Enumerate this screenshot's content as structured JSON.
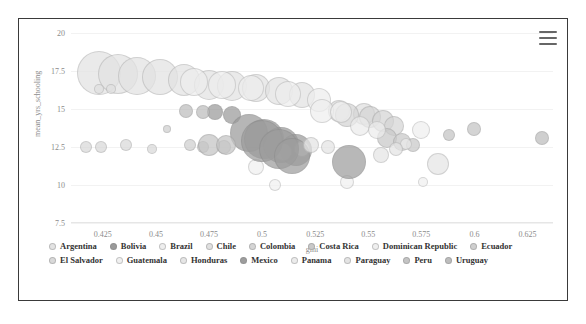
{
  "chart_data": {
    "type": "scatter",
    "title": "",
    "xlabel": "gini",
    "ylabel": "mean_yrs_schooling",
    "xlim": [
      0.41,
      0.637
    ],
    "ylim": [
      7.5,
      20
    ],
    "xticks": [
      "0.425",
      "0.45",
      "0.475",
      "0.5",
      "0.525",
      "0.55",
      "0.575",
      "0.6",
      "0.625"
    ],
    "xtick_values": [
      0.425,
      0.45,
      0.475,
      0.5,
      0.525,
      0.55,
      0.575,
      0.6,
      0.625
    ],
    "yticks": [
      "7.5",
      "10",
      "12.5",
      "15",
      "17.5",
      "20"
    ],
    "ytick_values": [
      7.5,
      10,
      12.5,
      15,
      17.5,
      20
    ],
    "grid": true,
    "legend_position": "bottom",
    "bubble_note": "bubble area encodes population; all series rendered in desaturated grayscale",
    "series": [
      {
        "name": "Argentina",
        "color": "#e3e3e3",
        "points": [
          {
            "x": 0.423,
            "y": 17.4,
            "r": 22
          },
          {
            "x": 0.432,
            "y": 17.3,
            "r": 20
          },
          {
            "x": 0.441,
            "y": 17.2,
            "r": 19
          },
          {
            "x": 0.452,
            "y": 17.1,
            "r": 18
          },
          {
            "x": 0.463,
            "y": 16.9,
            "r": 16
          },
          {
            "x": 0.475,
            "y": 16.6,
            "r": 15
          },
          {
            "x": 0.486,
            "y": 16.5,
            "r": 15
          },
          {
            "x": 0.497,
            "y": 16.4,
            "r": 14
          },
          {
            "x": 0.508,
            "y": 16.2,
            "r": 14
          },
          {
            "x": 0.519,
            "y": 15.9,
            "r": 13
          }
        ]
      },
      {
        "name": "Bolivia",
        "color": "#9a9a9a",
        "points": [
          {
            "x": 0.478,
            "y": 14.8,
            "r": 8
          },
          {
            "x": 0.486,
            "y": 14.6,
            "r": 9
          },
          {
            "x": 0.494,
            "y": 13.4,
            "r": 19
          },
          {
            "x": 0.501,
            "y": 13.0,
            "r": 20
          },
          {
            "x": 0.509,
            "y": 12.6,
            "r": 18
          },
          {
            "x": 0.516,
            "y": 12.3,
            "r": 16
          }
        ]
      },
      {
        "name": "Brazil",
        "color": "#eeeeee",
        "points": [
          {
            "x": 0.468,
            "y": 16.8,
            "r": 14
          },
          {
            "x": 0.481,
            "y": 16.6,
            "r": 14
          },
          {
            "x": 0.495,
            "y": 16.4,
            "r": 13
          },
          {
            "x": 0.512,
            "y": 16.0,
            "r": 13
          },
          {
            "x": 0.527,
            "y": 15.6,
            "r": 12
          }
        ]
      },
      {
        "name": "Chile",
        "color": "#e0e0e0",
        "points": [
          {
            "x": 0.423,
            "y": 16.3,
            "r": 5
          },
          {
            "x": 0.429,
            "y": 16.3,
            "r": 5
          },
          {
            "x": 0.536,
            "y": 14.9,
            "r": 11
          },
          {
            "x": 0.548,
            "y": 14.7,
            "r": 11
          }
        ]
      },
      {
        "name": "Colombia",
        "color": "#d5d5d5",
        "points": [
          {
            "x": 0.54,
            "y": 14.6,
            "r": 12
          },
          {
            "x": 0.551,
            "y": 14.5,
            "r": 11
          },
          {
            "x": 0.557,
            "y": 14.2,
            "r": 11
          },
          {
            "x": 0.562,
            "y": 13.9,
            "r": 10
          }
        ]
      },
      {
        "name": "Costa Rica",
        "color": "#c9c9c9",
        "points": [
          {
            "x": 0.559,
            "y": 13.1,
            "r": 10
          },
          {
            "x": 0.566,
            "y": 12.8,
            "r": 9
          },
          {
            "x": 0.571,
            "y": 12.6,
            "r": 7
          }
        ]
      },
      {
        "name": "Dominican Republic",
        "color": "#efefef",
        "points": [
          {
            "x": 0.528,
            "y": 14.9,
            "r": 12
          },
          {
            "x": 0.537,
            "y": 14.8,
            "r": 11
          },
          {
            "x": 0.575,
            "y": 13.6,
            "r": 9
          }
        ]
      },
      {
        "name": "Ecuador",
        "color": "#cfcfcf",
        "points": [
          {
            "x": 0.455,
            "y": 13.7,
            "r": 4
          },
          {
            "x": 0.466,
            "y": 12.6,
            "r": 6
          },
          {
            "x": 0.472,
            "y": 12.5,
            "r": 6
          },
          {
            "x": 0.482,
            "y": 12.5,
            "r": 7
          }
        ]
      },
      {
        "name": "El Salvador",
        "color": "#d9d9d9",
        "points": [
          {
            "x": 0.417,
            "y": 12.5,
            "r": 6
          },
          {
            "x": 0.424,
            "y": 12.5,
            "r": 6
          },
          {
            "x": 0.436,
            "y": 12.6,
            "r": 6
          },
          {
            "x": 0.448,
            "y": 12.4,
            "r": 5
          }
        ]
      },
      {
        "name": "Guatemala",
        "color": "#f0f0f0",
        "points": [
          {
            "x": 0.497,
            "y": 11.2,
            "r": 8
          },
          {
            "x": 0.506,
            "y": 10.0,
            "r": 6
          },
          {
            "x": 0.54,
            "y": 10.2,
            "r": 7
          },
          {
            "x": 0.576,
            "y": 10.2,
            "r": 5
          }
        ]
      },
      {
        "name": "Honduras",
        "color": "#e6e6e6",
        "points": [
          {
            "x": 0.51,
            "y": 12.2,
            "r": 9
          },
          {
            "x": 0.519,
            "y": 12.4,
            "r": 8
          },
          {
            "x": 0.556,
            "y": 12.0,
            "r": 8
          },
          {
            "x": 0.583,
            "y": 11.4,
            "r": 11
          }
        ]
      },
      {
        "name": "Mexico",
        "color": "#9d9d9d",
        "points": [
          {
            "x": 0.5,
            "y": 12.9,
            "r": 21
          },
          {
            "x": 0.508,
            "y": 12.4,
            "r": 20
          },
          {
            "x": 0.514,
            "y": 11.9,
            "r": 18
          },
          {
            "x": 0.541,
            "y": 11.5,
            "r": 17
          }
        ]
      },
      {
        "name": "Panama",
        "color": "#ececec",
        "points": [
          {
            "x": 0.546,
            "y": 13.9,
            "r": 10
          },
          {
            "x": 0.554,
            "y": 13.6,
            "r": 9
          },
          {
            "x": 0.568,
            "y": 12.7,
            "r": 6
          }
        ]
      },
      {
        "name": "Paraguay",
        "color": "#e4e4e4",
        "points": [
          {
            "x": 0.523,
            "y": 12.6,
            "r": 8
          },
          {
            "x": 0.531,
            "y": 12.5,
            "r": 7
          },
          {
            "x": 0.563,
            "y": 12.4,
            "r": 7
          }
        ]
      },
      {
        "name": "Peru",
        "color": "#c4c4c4",
        "points": [
          {
            "x": 0.475,
            "y": 12.6,
            "r": 11
          },
          {
            "x": 0.483,
            "y": 12.6,
            "r": 10
          },
          {
            "x": 0.588,
            "y": 13.3,
            "r": 6
          },
          {
            "x": 0.6,
            "y": 13.7,
            "r": 7
          }
        ]
      },
      {
        "name": "Uruguay",
        "color": "#bdbdbd",
        "points": [
          {
            "x": 0.464,
            "y": 14.9,
            "r": 7
          },
          {
            "x": 0.472,
            "y": 14.8,
            "r": 7
          },
          {
            "x": 0.632,
            "y": 13.1,
            "r": 7
          }
        ]
      }
    ]
  },
  "toolbar": {
    "menu_icon": "hamburger-menu-icon",
    "menu_title": "Chart context menu"
  }
}
